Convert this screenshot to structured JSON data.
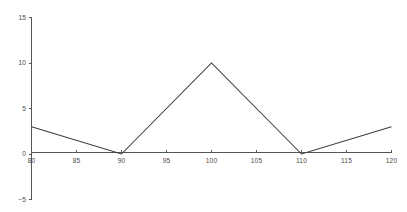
{
  "chart_data": {
    "type": "line",
    "title": "",
    "subtitle": "",
    "xlabel": "",
    "ylabel": "",
    "x": [
      80,
      90,
      100,
      110,
      120
    ],
    "values": [
      3,
      0,
      10,
      0,
      3
    ],
    "series": [
      {
        "name": "",
        "x": [
          80,
          90,
          100,
          110,
          120
        ],
        "values": [
          3,
          0,
          10,
          0,
          3
        ]
      }
    ],
    "xlim": [
      80,
      120
    ],
    "ylim": [
      -5,
      15
    ],
    "xticks": [
      80,
      85,
      90,
      95,
      100,
      105,
      110,
      115,
      120
    ],
    "yticks": [
      -5,
      0,
      5,
      10,
      15
    ],
    "xtick_labels": [
      "80",
      "85",
      "90",
      "95",
      "100",
      "105",
      "110",
      "115",
      "120"
    ],
    "ytick_labels": [
      "-5",
      "0",
      "5",
      "10",
      "15"
    ],
    "grid": false,
    "legend": false,
    "legend_position": "none",
    "annotations": [],
    "line_color": "#3a3a3a",
    "axis_color": "#555555",
    "label_color": "#4a4a4a",
    "background_color": "#ffffff"
  },
  "axes": {
    "y_labels": [
      {
        "text": "15",
        "value": 15
      },
      {
        "text": "10",
        "value": 10
      },
      {
        "text": "5",
        "value": 5
      },
      {
        "text": "0",
        "value": 0
      },
      {
        "text": "-5",
        "value": -5
      }
    ],
    "x_labels": [
      {
        "text": "80",
        "value": 80
      },
      {
        "text": "85",
        "value": 85
      },
      {
        "text": "90",
        "value": 90
      },
      {
        "text": "95",
        "value": 95
      },
      {
        "text": "100",
        "value": 100
      },
      {
        "text": "105",
        "value": 105
      },
      {
        "text": "110",
        "value": 110
      },
      {
        "text": "115",
        "value": 115
      },
      {
        "text": "120",
        "value": 120
      }
    ]
  }
}
